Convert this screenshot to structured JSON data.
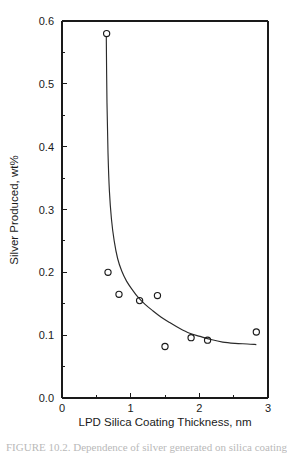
{
  "chart_data": {
    "type": "scatter",
    "title": "",
    "xlabel": "LPD Silica Coating Thickness, nm",
    "ylabel": "Silver Produced, wt%",
    "xlim": [
      0,
      3
    ],
    "ylim": [
      0.0,
      0.6
    ],
    "grid": false,
    "legend": null,
    "x_ticks": [
      "0",
      "1",
      "2",
      "3"
    ],
    "x_tick_values": [
      0,
      1,
      2,
      3
    ],
    "x_minor_tick_values": [
      0.5,
      1.5,
      2.5
    ],
    "y_ticks": [
      "0.0",
      "0.1",
      "0.2",
      "0.3",
      "0.4",
      "0.5",
      "0.6"
    ],
    "y_tick_values": [
      0.0,
      0.1,
      0.2,
      0.3,
      0.4,
      0.5,
      0.6
    ],
    "y_minor_tick_values": [
      0.05,
      0.15,
      0.25,
      0.35,
      0.45,
      0.55
    ],
    "marker": "open-circle",
    "series": [
      {
        "name": "Silver Produced",
        "marker": "open-circle",
        "points": [
          {
            "x": 0.65,
            "y": 0.58
          },
          {
            "x": 0.67,
            "y": 0.2
          },
          {
            "x": 0.83,
            "y": 0.165
          },
          {
            "x": 1.13,
            "y": 0.155
          },
          {
            "x": 1.39,
            "y": 0.163
          },
          {
            "x": 1.5,
            "y": 0.082
          },
          {
            "x": 1.88,
            "y": 0.096
          },
          {
            "x": 2.12,
            "y": 0.092
          },
          {
            "x": 2.83,
            "y": 0.105
          }
        ]
      }
    ],
    "fit_curve": {
      "name": "fitted decay curve",
      "points": [
        {
          "x": 0.645,
          "y": 0.575
        },
        {
          "x": 0.655,
          "y": 0.47
        },
        {
          "x": 0.67,
          "y": 0.39
        },
        {
          "x": 0.69,
          "y": 0.33
        },
        {
          "x": 0.72,
          "y": 0.285
        },
        {
          "x": 0.76,
          "y": 0.25
        },
        {
          "x": 0.81,
          "y": 0.222
        },
        {
          "x": 0.87,
          "y": 0.202
        },
        {
          "x": 0.94,
          "y": 0.186
        },
        {
          "x": 1.02,
          "y": 0.173
        },
        {
          "x": 1.11,
          "y": 0.16
        },
        {
          "x": 1.21,
          "y": 0.149
        },
        {
          "x": 1.32,
          "y": 0.139
        },
        {
          "x": 1.44,
          "y": 0.129
        },
        {
          "x": 1.57,
          "y": 0.12
        },
        {
          "x": 1.71,
          "y": 0.111
        },
        {
          "x": 1.86,
          "y": 0.103
        },
        {
          "x": 2.01,
          "y": 0.098
        },
        {
          "x": 2.17,
          "y": 0.093
        },
        {
          "x": 2.34,
          "y": 0.089
        },
        {
          "x": 2.52,
          "y": 0.087
        },
        {
          "x": 2.7,
          "y": 0.086
        },
        {
          "x": 2.83,
          "y": 0.085
        }
      ]
    }
  },
  "axes": {
    "x_title": "LPD Silica Coating Thickness, nm",
    "y_title": "Silver Produced, wt%"
  },
  "caption": {
    "text": "FIGURE 10.2. Dependence of silver generated on silica coating thickness."
  },
  "colors": {
    "background": "#ffffff",
    "ink": "#1a1a1a",
    "curve": "#2a2a2a",
    "caption_faded": "#b9b9b9"
  }
}
